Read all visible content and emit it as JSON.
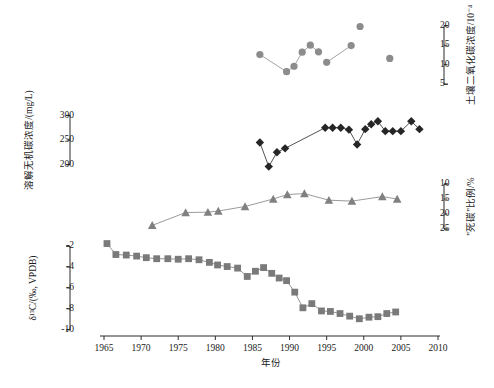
{
  "figure": {
    "xaxis": {
      "label": "年份",
      "ticks": [
        1965,
        1970,
        1975,
        1980,
        1985,
        1990,
        1995,
        2000,
        2005,
        2010
      ],
      "min": 1965,
      "max": 2010
    },
    "panels": [
      {
        "name": "soil-co2-panel",
        "axis_side": "right",
        "axis_label": "土壤二氧化碳浓度/10⁻⁴",
        "ticks": [
          5,
          10,
          15,
          20
        ],
        "min": 3,
        "max": 23,
        "inverted": false
      },
      {
        "name": "dic-panel",
        "axis_side": "left",
        "axis_label": "溶解无机碳浓度/(mg/L)",
        "ticks": [
          200,
          250,
          300
        ],
        "min": 185,
        "max": 315,
        "inverted": false
      },
      {
        "name": "dead-carbon-panel",
        "axis_side": "right",
        "axis_label": "\"死碳\"比例/%",
        "ticks": [
          10,
          15,
          20,
          25
        ],
        "min": 8,
        "max": 26,
        "inverted": true
      },
      {
        "name": "delta13c-panel",
        "axis_side": "left",
        "axis_label": "δ¹³C/(‰, VPDB)",
        "ticks": [
          -10,
          -8,
          -6,
          -4,
          -2
        ],
        "min": -10.6,
        "max": -1.6,
        "inverted": false
      }
    ]
  },
  "chart_data": {
    "type": "scatter",
    "title": "",
    "xlabel": "年份",
    "ylabel": "",
    "grid": false,
    "legend": "none",
    "xlim": [
      1965,
      2010
    ],
    "series": [
      {
        "name": "土壤二氧化碳浓度",
        "marker": "circle",
        "color": "#8c8c8c",
        "ylabel": "土壤二氧化碳浓度/10⁻⁴",
        "ylim": [
          3,
          23
        ],
        "connected": false,
        "points": [
          {
            "x": 1986.0,
            "y": 12.6,
            "link": false
          },
          {
            "x": 1989.6,
            "y": 8.2,
            "link": true
          },
          {
            "x": 1990.6,
            "y": 9.6,
            "link": true
          },
          {
            "x": 1991.7,
            "y": 13.2,
            "link": true
          },
          {
            "x": 1992.8,
            "y": 15.0,
            "link": true
          },
          {
            "x": 1993.9,
            "y": 13.3,
            "link": true
          },
          {
            "x": 1995.0,
            "y": 10.6,
            "link": false
          },
          {
            "x": 1998.3,
            "y": 14.9,
            "link": true
          },
          {
            "x": 1999.5,
            "y": 19.8,
            "link": false
          },
          {
            "x": 2003.5,
            "y": 11.6,
            "link": false
          }
        ]
      },
      {
        "name": "溶解无机碳浓度",
        "marker": "diamond",
        "color": "#262626",
        "ylabel": "溶解无机碳浓度/(mg/L)",
        "ylim": [
          185,
          315
        ],
        "connected": true,
        "points": [
          {
            "x": 1986.0,
            "y": 245
          },
          {
            "x": 1987.2,
            "y": 196
          },
          {
            "x": 1988.3,
            "y": 225
          },
          {
            "x": 1989.4,
            "y": 233
          },
          {
            "x": 1994.8,
            "y": 275
          },
          {
            "x": 1995.8,
            "y": 275
          },
          {
            "x": 1996.9,
            "y": 275
          },
          {
            "x": 1998.0,
            "y": 271
          },
          {
            "x": 1999.1,
            "y": 241
          },
          {
            "x": 2000.2,
            "y": 272
          },
          {
            "x": 2001.0,
            "y": 282
          },
          {
            "x": 2001.9,
            "y": 288
          },
          {
            "x": 2002.9,
            "y": 268
          },
          {
            "x": 2003.9,
            "y": 268
          },
          {
            "x": 2005.0,
            "y": 268
          },
          {
            "x": 2006.4,
            "y": 288
          },
          {
            "x": 2007.5,
            "y": 272
          }
        ]
      },
      {
        "name": "\"死碳\"比例",
        "marker": "triangle",
        "color": "#808080",
        "ylabel": "\"死碳\"比例/%",
        "ylim": [
          8,
          26
        ],
        "inverted": true,
        "connected": true,
        "points": [
          {
            "x": 1971.5,
            "y": 23.8
          },
          {
            "x": 1976.0,
            "y": 19.5
          },
          {
            "x": 1979.0,
            "y": 19.4
          },
          {
            "x": 1980.4,
            "y": 19.0
          },
          {
            "x": 1984.0,
            "y": 17.5
          },
          {
            "x": 1987.8,
            "y": 15.0
          },
          {
            "x": 1989.7,
            "y": 13.5
          },
          {
            "x": 1992.0,
            "y": 13.2
          },
          {
            "x": 1995.3,
            "y": 15.4
          },
          {
            "x": 1998.4,
            "y": 15.7
          },
          {
            "x": 2002.5,
            "y": 14.2
          },
          {
            "x": 2004.5,
            "y": 15.0
          }
        ]
      },
      {
        "name": "δ¹³C",
        "marker": "square",
        "color": "#7a7a7a",
        "ylabel": "δ¹³C/(‰, VPDB)",
        "ylim": [
          -10.6,
          -1.6
        ],
        "connected": true,
        "points": [
          {
            "x": 1965.4,
            "y": -1.75
          },
          {
            "x": 1966.6,
            "y": -2.8
          },
          {
            "x": 1968.0,
            "y": -2.85
          },
          {
            "x": 1969.4,
            "y": -2.95
          },
          {
            "x": 1970.7,
            "y": -3.1
          },
          {
            "x": 1972.1,
            "y": -3.2
          },
          {
            "x": 1973.6,
            "y": -3.2
          },
          {
            "x": 1975.0,
            "y": -3.25
          },
          {
            "x": 1976.4,
            "y": -3.2
          },
          {
            "x": 1977.8,
            "y": -3.3
          },
          {
            "x": 1979.2,
            "y": -3.55
          },
          {
            "x": 1980.3,
            "y": -3.8
          },
          {
            "x": 1981.6,
            "y": -3.95
          },
          {
            "x": 1983.0,
            "y": -4.1
          },
          {
            "x": 1984.3,
            "y": -4.9
          },
          {
            "x": 1985.4,
            "y": -4.4
          },
          {
            "x": 1986.5,
            "y": -4.05
          },
          {
            "x": 1987.6,
            "y": -4.6
          },
          {
            "x": 1988.6,
            "y": -5.05
          },
          {
            "x": 1989.6,
            "y": -5.3
          },
          {
            "x": 1990.7,
            "y": -6.4
          },
          {
            "x": 1991.8,
            "y": -7.9
          },
          {
            "x": 1993.0,
            "y": -7.5
          },
          {
            "x": 1994.3,
            "y": -8.2
          },
          {
            "x": 1995.5,
            "y": -8.25
          },
          {
            "x": 1996.8,
            "y": -8.45
          },
          {
            "x": 1998.1,
            "y": -8.7
          },
          {
            "x": 1999.4,
            "y": -8.95
          },
          {
            "x": 2000.7,
            "y": -8.8
          },
          {
            "x": 2001.9,
            "y": -8.75
          },
          {
            "x": 2003.1,
            "y": -8.45
          },
          {
            "x": 2004.3,
            "y": -8.3
          }
        ]
      }
    ]
  }
}
